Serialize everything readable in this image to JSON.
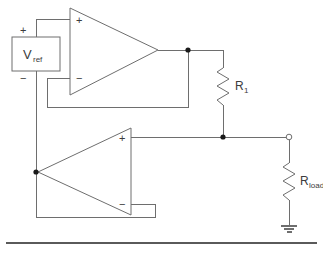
{
  "figure": {
    "kind": "circuit-schematic",
    "title": "",
    "background_color": "#ffffff",
    "wire_color": "#6e6e6e",
    "node_color": "#1a1a1a",
    "label_color": "#3c3c3c"
  },
  "source": {
    "name": "V",
    "subscript": "ref",
    "plus_sign": "+",
    "minus_sign": "−"
  },
  "opamp1": {
    "plus_sign": "+",
    "minus_sign": "−",
    "orientation": "points-right"
  },
  "opamp2": {
    "plus_sign": "+",
    "minus_sign": "−",
    "orientation": "points-left"
  },
  "resistor_r1": {
    "name": "R",
    "subscript": "1"
  },
  "resistor_rload": {
    "name": "R",
    "subscript": "load"
  },
  "terminals": {
    "output_node": "open-circle",
    "ground": "ground-symbol"
  }
}
